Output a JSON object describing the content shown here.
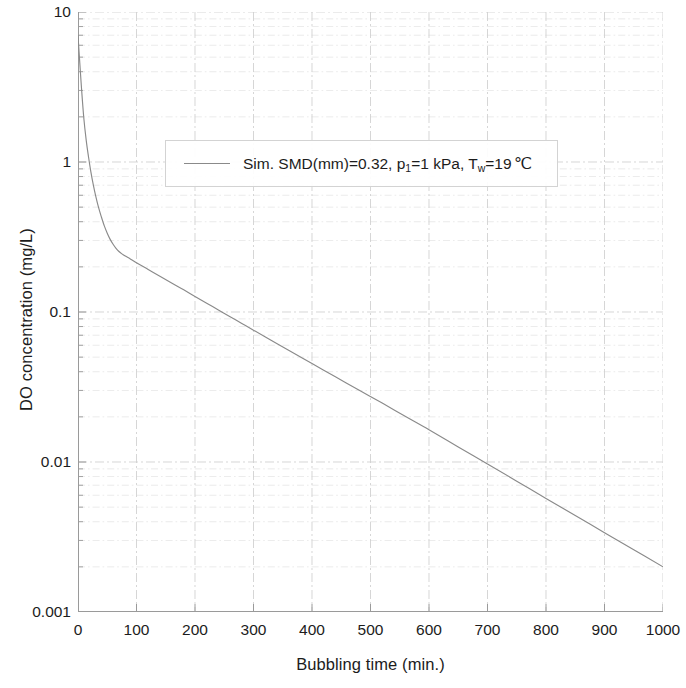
{
  "chart_data": {
    "type": "line",
    "title": "",
    "xlabel": "Bubbling time (min.)",
    "ylabel": "DO concentration (mg/L)",
    "xlim": [
      0,
      1000
    ],
    "ylim": [
      0.001,
      10
    ],
    "yscale": "log",
    "xscale": "linear",
    "grid": true,
    "grid_style": "dash-dot",
    "grid_color": "#d9d9d9",
    "legend_position": "upper center",
    "xticks": [
      "0",
      "100",
      "200",
      "300",
      "400",
      "500",
      "600",
      "700",
      "800",
      "900",
      "1000"
    ],
    "xtick_values": [
      0,
      100,
      200,
      300,
      400,
      500,
      600,
      700,
      800,
      900,
      1000
    ],
    "yticks": [
      "10",
      "1",
      "0.1",
      "0.01",
      "0.001"
    ],
    "ytick_values": [
      10,
      1,
      0.1,
      0.01,
      0.001
    ],
    "series": [
      {
        "name": "Sim. SMD(mm)=0.32, p1=1 kPa, Tw=19℃",
        "legend_prefix": "Sim. SMD(mm)=0.32, p",
        "legend_sub1": "1",
        "legend_mid": "=1 kPa, T",
        "legend_sub2": "w",
        "legend_suffix": "=19",
        "legend_unit": "℃",
        "color": "#8a8a8a",
        "linewidth": 1,
        "x": [
          0,
          3,
          6,
          10,
          14,
          18,
          22,
          26,
          30,
          35,
          40,
          45,
          50,
          55,
          60,
          65,
          70,
          75,
          80,
          90,
          100,
          120,
          140,
          160,
          180,
          200,
          220,
          240,
          260,
          280,
          300,
          330,
          360,
          400,
          440,
          480,
          520,
          560,
          600,
          650,
          700,
          750,
          800,
          850,
          900,
          950,
          1000
        ],
        "y": [
          7.0,
          4.6,
          3.1,
          1.95,
          1.4,
          1.08,
          0.86,
          0.71,
          0.6,
          0.5,
          0.43,
          0.375,
          0.335,
          0.305,
          0.283,
          0.266,
          0.253,
          0.244,
          0.237,
          0.225,
          0.213,
          0.192,
          0.173,
          0.156,
          0.141,
          0.127,
          0.1145,
          0.1032,
          0.0931,
          0.0839,
          0.0757,
          0.0648,
          0.0555,
          0.0453,
          0.037,
          0.0302,
          0.0247,
          0.0201,
          0.0164,
          0.0126,
          0.0097,
          0.00745,
          0.00572,
          0.0044,
          0.00338,
          0.0026,
          0.002
        ]
      }
    ],
    "minor_gridlines_y": [
      9,
      8,
      7,
      6,
      5,
      4,
      3,
      2,
      0.9,
      0.8,
      0.7,
      0.6,
      0.5,
      0.4,
      0.3,
      0.2,
      0.09,
      0.08,
      0.07,
      0.06,
      0.05,
      0.04,
      0.03,
      0.02,
      0.009,
      0.008,
      0.007,
      0.006,
      0.005,
      0.004,
      0.003,
      0.002
    ],
    "axis_color": "#9a9a9a"
  }
}
